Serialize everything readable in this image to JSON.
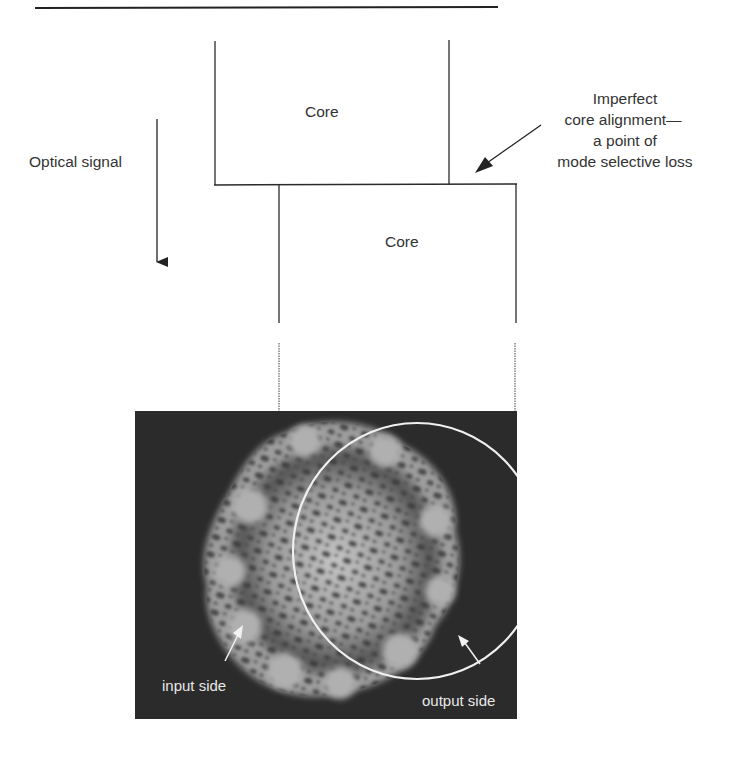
{
  "figure": {
    "type": "fiber splice misalignment diagram",
    "labels": {
      "upper_core": "Core",
      "lower_core": "Core",
      "signal": "Optical signal",
      "annotation_line1": "Imperfect",
      "annotation_line2": "core alignment—",
      "annotation_line3": "a point of",
      "annotation_line4": "mode selective loss",
      "input_side": "input side",
      "output_side": "output side"
    },
    "colors": {
      "line": "#2a2a2a",
      "photo_bg": "#2b2b2b",
      "speckle_light": "#bdbdbd",
      "annotation_white": "#f2f2f2"
    }
  }
}
